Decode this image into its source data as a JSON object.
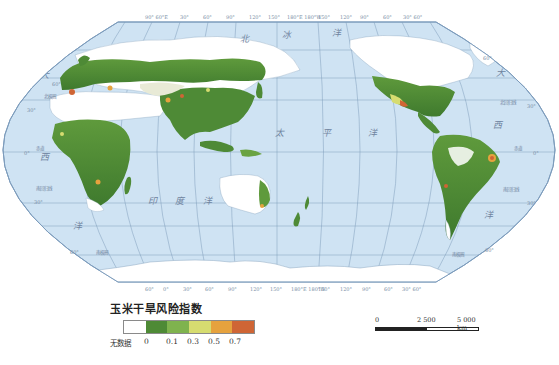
{
  "map": {
    "title": "玉米干旱风险指数",
    "projection": "Pacific-centered world map",
    "ocean_color": "#cfe3f3",
    "land_nodata_color": "#ffffff",
    "graticule_color": "#6d8bab",
    "top_ticks": [
      "90° 60°E",
      "30°",
      "60°",
      "90°",
      "120°",
      "150°",
      "180°E 180°W",
      "150°",
      "120°",
      "90°",
      "60°",
      "30° 60°"
    ],
    "bottom_ticks": [
      "60°",
      "0°",
      "30°",
      "60°",
      "90°",
      "120°",
      "150°",
      "180°E 180°W",
      "150°",
      "120°",
      "90°",
      "60°",
      "30° 60°"
    ],
    "left_ticks": [
      "60°",
      "30°",
      "0°",
      "30°",
      "60°"
    ],
    "right_ticks": [
      "60°",
      "30°",
      "0°",
      "30°",
      "60°"
    ],
    "ocean_labels": {
      "arctic": [
        "北",
        "冰",
        "洋"
      ],
      "atlantic_left": [
        "大",
        "西",
        "洋"
      ],
      "atlantic_right": [
        "大",
        "西",
        "洋"
      ],
      "indian": [
        "印",
        "度",
        "洋"
      ],
      "pacific": [
        "太",
        "平",
        "洋"
      ]
    },
    "line_labels": {
      "arctic_circle_left": "北极圈",
      "tropic_cancer_right": "北回归线",
      "equator_left": "赤道",
      "equator_right": "赤道",
      "tropic_capricorn_left": "南回归线",
      "tropic_capricorn_right": "南回归线",
      "antarctic_circle_left": "南极圈",
      "antarctic_circle_right": "南极圈"
    }
  },
  "legend": {
    "title": "玉米干旱风险指数",
    "items": [
      {
        "label": "无数据",
        "color": "#ffffff"
      },
      {
        "label": "0",
        "color": "#4e8a36"
      },
      {
        "label": "0.1",
        "color": "#7fb34e"
      },
      {
        "label": "0.3",
        "color": "#d6dc70"
      },
      {
        "label": "0.5",
        "color": "#e6a23e"
      },
      {
        "label": "0.7",
        "color": "#cf6535"
      }
    ],
    "tick_labels": [
      "无数据",
      "0",
      "0.1",
      "0.3",
      "0.5",
      "0.7"
    ]
  },
  "scale_bar": {
    "labels": [
      "0",
      "2 500",
      "5 000 km"
    ]
  }
}
